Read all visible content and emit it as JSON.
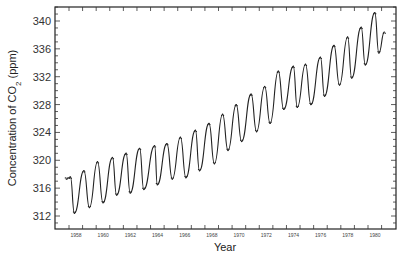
{
  "chart_data": {
    "type": "line",
    "title": "",
    "xlabel": "Year",
    "ylabel": "Concentration of CO2 (ppm)",
    "ylabel_parts": {
      "pre": "Concentration of CO",
      "sub": "2",
      "post": " (ppm)"
    },
    "xlim": [
      1957.8,
      1981.5
    ],
    "ylim": [
      310.1,
      342.1
    ],
    "grid": false,
    "legend": null,
    "y_ticks": [
      312,
      316,
      320,
      324,
      328,
      332,
      336,
      340
    ],
    "x_ticks": [
      1958,
      1960,
      1962,
      1964,
      1966,
      1968,
      1970,
      1972,
      1974,
      1976,
      1978,
      1980
    ],
    "line_color": "#222222",
    "series": [
      {
        "name": "Monthly CO2 (Mauna Loa)",
        "points": [
          [
            1957.8,
            317.3
          ],
          [
            1958.1,
            317.6
          ],
          [
            1958.4,
            312.4
          ],
          [
            1959.1,
            318.5
          ],
          [
            1959.5,
            313.2
          ],
          [
            1960.1,
            319.8
          ],
          [
            1960.5,
            313.9
          ],
          [
            1961.2,
            320.4
          ],
          [
            1961.5,
            315.0
          ],
          [
            1962.2,
            321.0
          ],
          [
            1962.5,
            315.3
          ],
          [
            1963.2,
            321.7
          ],
          [
            1963.5,
            315.8
          ],
          [
            1964.3,
            322.1
          ],
          [
            1964.5,
            316.5
          ],
          [
            1965.2,
            322.4
          ],
          [
            1965.6,
            317.3
          ],
          [
            1966.2,
            323.3
          ],
          [
            1966.6,
            317.5
          ],
          [
            1967.3,
            324.3
          ],
          [
            1967.6,
            318.5
          ],
          [
            1968.3,
            325.3
          ],
          [
            1968.7,
            319.5
          ],
          [
            1969.3,
            326.6
          ],
          [
            1969.7,
            321.4
          ],
          [
            1970.3,
            328.0
          ],
          [
            1970.7,
            322.7
          ],
          [
            1971.4,
            329.5
          ],
          [
            1971.8,
            324.1
          ],
          [
            1972.4,
            330.6
          ],
          [
            1972.8,
            325.3
          ],
          [
            1973.4,
            332.8
          ],
          [
            1973.8,
            327.3
          ],
          [
            1974.5,
            333.5
          ],
          [
            1974.8,
            327.6
          ],
          [
            1975.4,
            333.8
          ],
          [
            1975.8,
            328.0
          ],
          [
            1976.5,
            334.8
          ],
          [
            1976.8,
            329.2
          ],
          [
            1977.5,
            336.5
          ],
          [
            1977.9,
            330.8
          ],
          [
            1978.5,
            337.7
          ],
          [
            1978.8,
            331.8
          ],
          [
            1979.5,
            339.1
          ],
          [
            1979.8,
            333.7
          ],
          [
            1980.5,
            341.2
          ],
          [
            1980.8,
            335.4
          ],
          [
            1981.2,
            338.4
          ]
        ]
      }
    ]
  }
}
